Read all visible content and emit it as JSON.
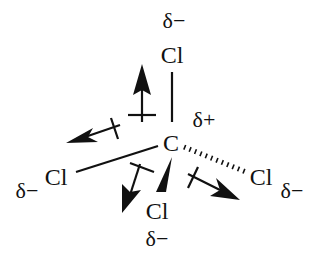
{
  "diagram": {
    "title": "",
    "molecule": "CCl4",
    "central_atom": {
      "symbol": "C",
      "charge": "δ+"
    },
    "substituents": [
      {
        "position": "top",
        "symbol": "Cl",
        "charge": "δ−",
        "bond": "line"
      },
      {
        "position": "left",
        "symbol": "Cl",
        "charge": "δ−",
        "bond": "line"
      },
      {
        "position": "right",
        "symbol": "Cl",
        "charge": "δ−",
        "bond": "hashed"
      },
      {
        "position": "bottom",
        "symbol": "Cl",
        "charge": "δ−",
        "bond": "wedge"
      }
    ],
    "dipole_arrows": [
      {
        "direction": "up"
      },
      {
        "direction": "left"
      },
      {
        "direction": "down-left"
      },
      {
        "direction": "down-right"
      }
    ],
    "colors": {
      "ink": "#111111",
      "background": "#ffffff"
    }
  }
}
